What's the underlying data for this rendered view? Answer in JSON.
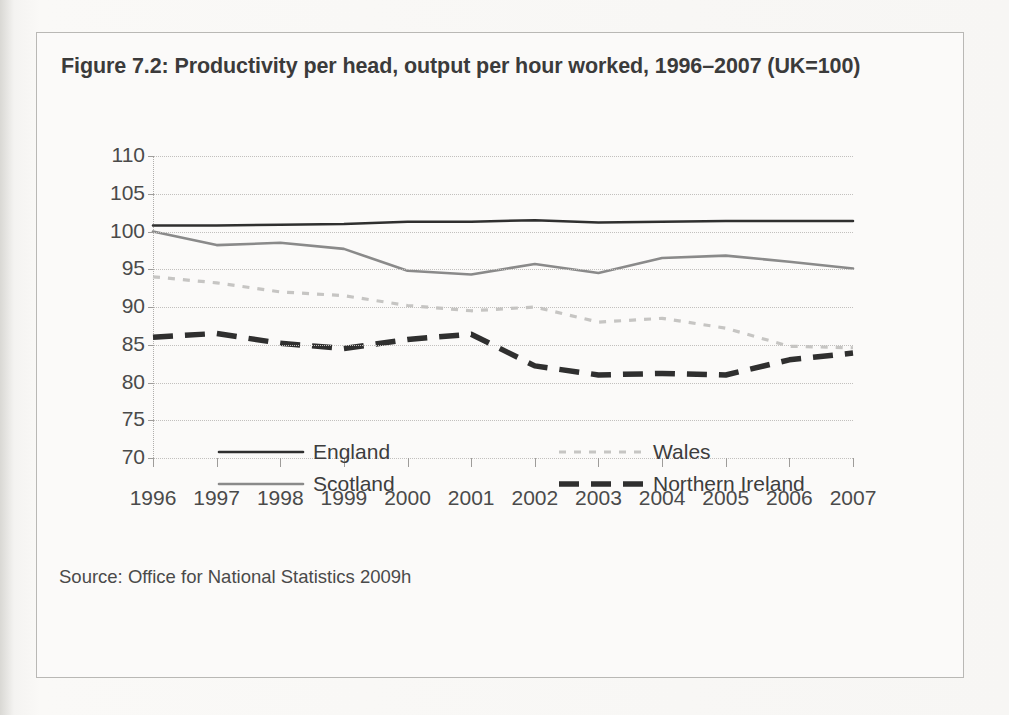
{
  "figure": {
    "title": "Figure 7.2: Productivity per head, output per hour worked, 1996–2007 (UK=100)",
    "source": "Source: Office for National Statistics 2009h"
  },
  "legend": {
    "position": "below-plot",
    "entries": [
      {
        "label": "England",
        "style": "solid",
        "color": "#2f2f2f",
        "icon": "solid-line-swatch"
      },
      {
        "label": "Scotland",
        "style": "solid",
        "color": "#8a8a8a",
        "icon": "solid-line-swatch"
      },
      {
        "label": "Wales",
        "style": "dotted",
        "color": "#c6c5c3",
        "icon": "dotted-line-swatch"
      },
      {
        "label": "Northern Ireland",
        "style": "dashed",
        "color": "#2f2f2f",
        "icon": "dashed-line-swatch"
      }
    ]
  },
  "chart_data": {
    "type": "line",
    "title": "Figure 7.2: Productivity per head, output per hour worked, 1996–2007 (UK=100)",
    "xlabel": "",
    "ylabel": "",
    "grid": true,
    "legend_position": "bottom",
    "x": [
      1996,
      1997,
      1998,
      1999,
      2000,
      2001,
      2002,
      2003,
      2004,
      2005,
      2006,
      2007
    ],
    "categories": [
      "1996",
      "1997",
      "1998",
      "1999",
      "2000",
      "2001",
      "2002",
      "2003",
      "2004",
      "2005",
      "2006",
      "2007"
    ],
    "xlim": [
      1996,
      2007
    ],
    "ylim": [
      70,
      110
    ],
    "yticks": [
      110,
      105,
      100,
      95,
      90,
      85,
      80,
      75,
      70
    ],
    "series": [
      {
        "name": "England",
        "color": "#2f2f2f",
        "style": "solid",
        "values": [
          100.8,
          100.8,
          100.9,
          101.0,
          101.3,
          101.3,
          101.5,
          101.2,
          101.3,
          101.4,
          101.4,
          101.4
        ]
      },
      {
        "name": "Scotland",
        "color": "#8a8a8a",
        "style": "solid",
        "values": [
          100.0,
          98.2,
          98.5,
          97.7,
          94.8,
          94.3,
          95.7,
          94.5,
          96.5,
          96.8,
          96.0,
          95.1
        ]
      },
      {
        "name": "Wales",
        "color": "#c6c5c3",
        "style": "dotted",
        "values": [
          94.0,
          93.2,
          92.0,
          91.5,
          90.2,
          89.5,
          90.0,
          88.0,
          88.5,
          87.2,
          84.8,
          84.6
        ]
      },
      {
        "name": "Northern Ireland",
        "color": "#2f2f2f",
        "style": "dashed",
        "values": [
          86.0,
          86.5,
          85.2,
          84.5,
          85.7,
          86.4,
          82.2,
          81.0,
          81.2,
          81.0,
          83.0,
          83.9
        ]
      }
    ]
  }
}
